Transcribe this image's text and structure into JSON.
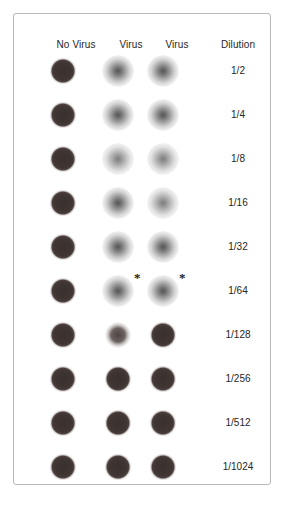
{
  "figure": {
    "panel_border_color": "#b9b9b9",
    "background_color": "#ffffff",
    "text_color": "#262626"
  },
  "headers": [
    {
      "label": "No Virus"
    },
    {
      "label": "Virus"
    },
    {
      "label": "Virus"
    },
    {
      "label": "Dilution"
    }
  ],
  "dilutions": [
    "1/2",
    "1/4",
    "1/8",
    "1/16",
    "1/32",
    "1/64",
    "1/128",
    "1/256",
    "1/512",
    "1/1024"
  ],
  "annotations": {
    "asterisk_symbol": "*",
    "asterisk_rows": [
      6
    ],
    "asterisk_columns": [
      2,
      3
    ]
  },
  "chart_data": {
    "type": "table",
    "xlabel": "Sample column",
    "ylabel": "Serum dilution",
    "columns": [
      "No Virus",
      "Virus",
      "Virus",
      "Dilution"
    ],
    "rows": [
      {
        "dilution": "1/2",
        "no_virus": "button",
        "virus_1": "diffuse",
        "virus_2": "diffuse",
        "asterisk": false
      },
      {
        "dilution": "1/4",
        "no_virus": "button",
        "virus_1": "diffuse",
        "virus_2": "diffuse",
        "asterisk": false
      },
      {
        "dilution": "1/8",
        "no_virus": "button",
        "virus_1": "diffuse-light",
        "virus_2": "diffuse-light",
        "asterisk": false
      },
      {
        "dilution": "1/16",
        "no_virus": "button",
        "virus_1": "diffuse",
        "virus_2": "diffuse-light",
        "asterisk": false
      },
      {
        "dilution": "1/32",
        "no_virus": "button",
        "virus_1": "diffuse",
        "virus_2": "diffuse",
        "asterisk": false
      },
      {
        "dilution": "1/64",
        "no_virus": "button",
        "virus_1": "diffuse",
        "virus_2": "diffuse",
        "asterisk": true
      },
      {
        "dilution": "1/128",
        "no_virus": "button",
        "virus_1": "button-weak",
        "virus_2": "button",
        "asterisk": false
      },
      {
        "dilution": "1/256",
        "no_virus": "button",
        "virus_1": "button",
        "virus_2": "button",
        "asterisk": false
      },
      {
        "dilution": "1/512",
        "no_virus": "button",
        "virus_1": "button",
        "virus_2": "button",
        "asterisk": false
      },
      {
        "dilution": "1/1024",
        "no_virus": "button",
        "virus_1": "button",
        "virus_2": "button",
        "asterisk": false
      }
    ],
    "legend": [
      {
        "key": "button",
        "meaning": "Compact dark pellet - no hemagglutination (inhibition)"
      },
      {
        "key": "button-weak",
        "meaning": "Faint diffuse pellet - partial hemagglutination"
      },
      {
        "key": "diffuse",
        "meaning": "Diffuse shield - complete hemagglutination"
      }
    ],
    "endpoint_marker": "*",
    "grid": false,
    "legend_position": "none"
  },
  "layout": {
    "column_x": [
      62,
      117,
      162
    ],
    "row_y_start": 70,
    "row_spacing": 44,
    "well_diameter": 38
  }
}
